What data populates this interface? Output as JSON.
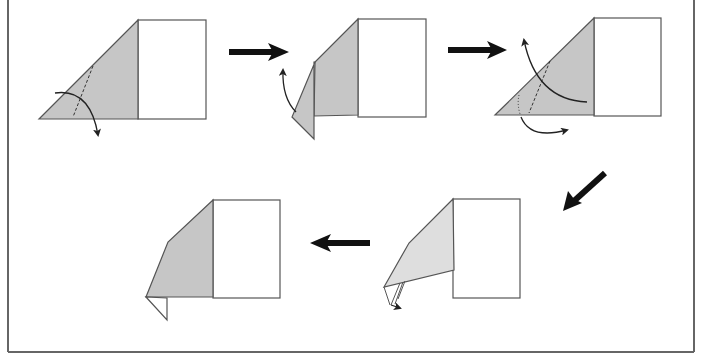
{
  "diagram": {
    "type": "origami-folding-steps",
    "colors": {
      "background": "#ffffff",
      "paper_colored": "#c6c6c6",
      "paper_colored_light": "#dedede",
      "paper_white": "#ffffff",
      "outline": "#555555",
      "arrow": "#111111",
      "frame": "#666666"
    },
    "steps": [
      {
        "index": 1,
        "label": "",
        "action": "valley fold corner down along dashed line"
      },
      {
        "index": 2,
        "label": "",
        "action": "fold flap back up"
      },
      {
        "index": 3,
        "label": "",
        "action": "inside reverse fold along dashed/dotted lines"
      },
      {
        "index": 4,
        "label": "",
        "action": "result with small tucked point"
      },
      {
        "index": 5,
        "label": "",
        "action": "finished shape"
      }
    ],
    "flow_arrows": [
      {
        "from": 1,
        "to": 2,
        "direction": "right"
      },
      {
        "from": 2,
        "to": 3,
        "direction": "right"
      },
      {
        "from": 3,
        "to": 4,
        "direction": "down-left"
      },
      {
        "from": 4,
        "to": 5,
        "direction": "left"
      }
    ]
  }
}
